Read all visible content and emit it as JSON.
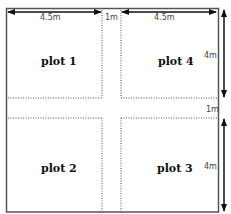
{
  "diagram": {
    "plots": [
      {
        "id": "plot1",
        "label": "plot 1"
      },
      {
        "id": "plot4",
        "label": "plot 4"
      },
      {
        "id": "plot2",
        "label": "plot 2"
      },
      {
        "id": "plot3",
        "label": "plot 3"
      }
    ],
    "dimensions": {
      "top_left_width": "4.5m",
      "gap_width": "1m",
      "top_right_width": "4.5m",
      "right_top_height": "4m",
      "gap_height": "1m",
      "right_bottom_height": "4m"
    },
    "colors": {
      "border": "#444444",
      "dotted": "#555555",
      "arrow": "#111111"
    }
  }
}
